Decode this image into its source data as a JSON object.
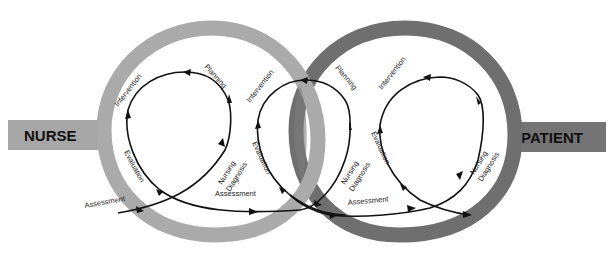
{
  "diagram": {
    "type": "interlocking-rings-process",
    "colors": {
      "nurse_ring": "#aaaaaa",
      "patient_ring": "#6f6f6f",
      "overlap": "#7d7d7d",
      "nurse_bar": "#a6a6a6",
      "patient_bar": "#747474",
      "flow_line": "#111111",
      "background": "#ffffff"
    },
    "left_bar": {
      "label": "NURSE"
    },
    "right_bar": {
      "label": "PATIENT"
    },
    "loops": [
      {
        "id": "loop-1",
        "labels": {
          "assessment": "Assessment",
          "nursing_diagnosis_line1": "Nursing",
          "nursing_diagnosis_line2": "Diagnosis",
          "planning": "Planning",
          "intervention": "Intervention",
          "evaluation": "Evaluation"
        }
      },
      {
        "id": "loop-2",
        "labels": {
          "assessment": "Assessment",
          "nursing_diagnosis_line1": "Nursing",
          "nursing_diagnosis_line2": "Diagnosis",
          "planning": "Planning",
          "intervention": "Intervention",
          "evaluation": "Evaluation"
        }
      },
      {
        "id": "loop-3",
        "labels": {
          "assessment": "Assessment",
          "nursing_diagnosis_line1": "Nursing",
          "nursing_diagnosis_line2": "Diagnosis",
          "intervention": "Intervention",
          "evaluation": "Evaluation"
        }
      }
    ],
    "steps_sequence": [
      "Assessment",
      "Nursing Diagnosis",
      "Planning",
      "Intervention",
      "Evaluation"
    ]
  }
}
